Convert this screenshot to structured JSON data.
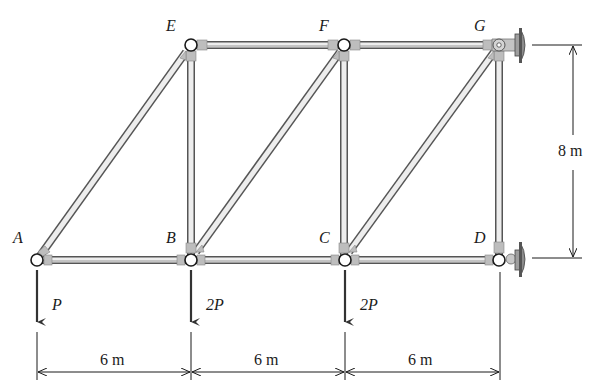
{
  "joints": {
    "A": {
      "label": "A",
      "x": 37,
      "y": 260
    },
    "B": {
      "label": "B",
      "x": 191,
      "y": 260
    },
    "C": {
      "label": "C",
      "x": 345,
      "y": 260
    },
    "D": {
      "label": "D",
      "x": 499,
      "y": 260
    },
    "E": {
      "label": "E",
      "x": 191,
      "y": 45
    },
    "F": {
      "label": "F",
      "x": 344,
      "y": 45
    },
    "G": {
      "label": "G",
      "x": 499,
      "y": 45
    }
  },
  "members": [
    "AB",
    "BC",
    "CD",
    "EF",
    "FG",
    "AE",
    "BE",
    "BF",
    "CF",
    "CG",
    "DG"
  ],
  "loads": [
    {
      "joint": "A",
      "label": "P"
    },
    {
      "joint": "B",
      "label": "2P"
    },
    {
      "joint": "C",
      "label": "2P"
    }
  ],
  "supports": [
    {
      "joint": "G",
      "type": "pin"
    },
    {
      "joint": "D",
      "type": "roller"
    }
  ],
  "dimensions": {
    "horizontal": [
      "6 m",
      "6 m",
      "6 m"
    ],
    "vertical": "8 m"
  },
  "colors": {
    "member_fill": "#ececec",
    "member_edge": "#555555",
    "gusset": "#bdbdbd",
    "wall": "#8c8c8c",
    "line": "#1a1a1a"
  }
}
